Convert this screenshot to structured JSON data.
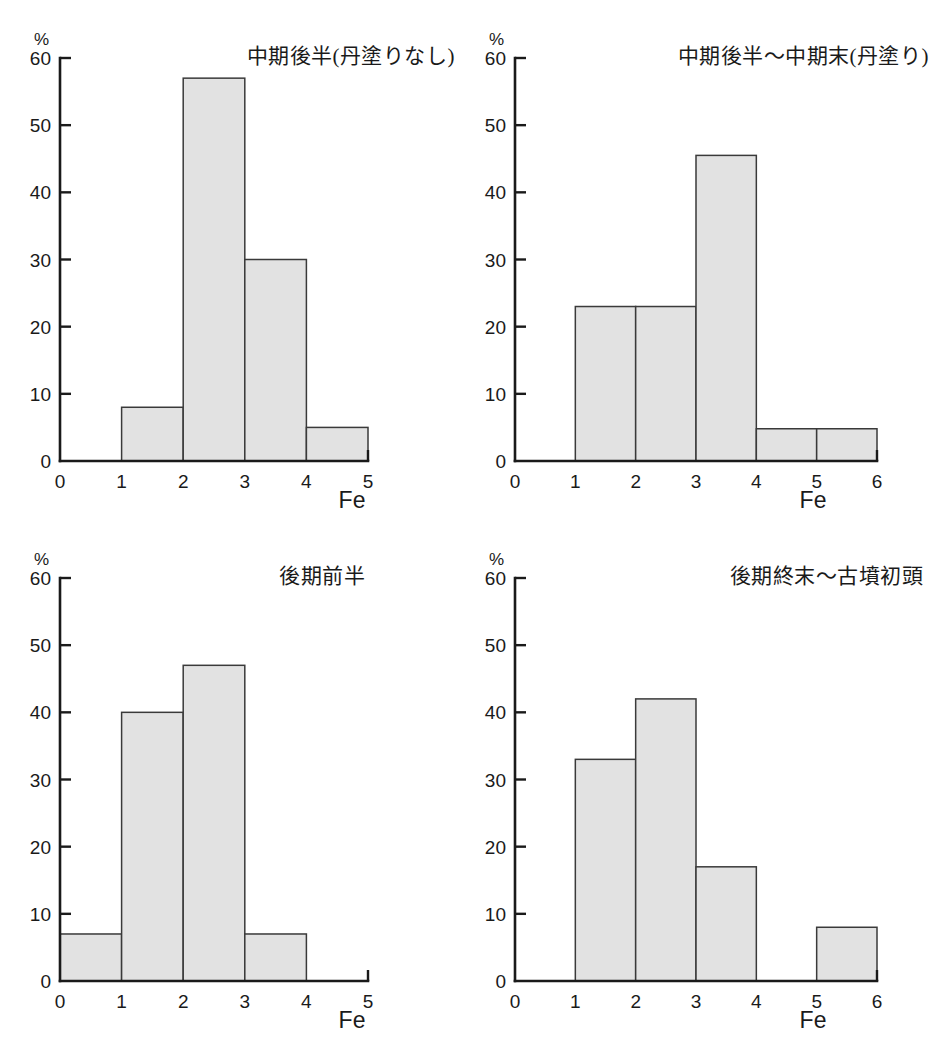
{
  "figure": {
    "background_color": "#ffffff",
    "bar_fill_color": "#e2e2e2",
    "bar_stroke_color": "#3a3a3a",
    "axis_color": "#1a1a1a",
    "y_unit_label": "%",
    "x_axis_title": "Fe",
    "caption": ""
  },
  "chart_data": [
    {
      "id": "chart-naka-kouhan-ninuri-nashi",
      "type": "bar",
      "title": "中期後半(丹塗りなし)",
      "xlabel": "Fe",
      "ylabel": "%",
      "xlim": [
        0,
        5
      ],
      "ylim": [
        0,
        60
      ],
      "grid": false,
      "legend": "none",
      "xticks": [
        "0",
        "1",
        "2",
        "3",
        "4",
        "5"
      ],
      "yticks": [
        "0",
        "10",
        "20",
        "30",
        "40",
        "50",
        "60"
      ],
      "bins": [
        {
          "x0": 0,
          "x1": 1,
          "value": 0
        },
        {
          "x0": 1,
          "x1": 2,
          "value": 8
        },
        {
          "x0": 2,
          "x1": 3,
          "value": 57
        },
        {
          "x0": 3,
          "x1": 4,
          "value": 30
        },
        {
          "x0": 4,
          "x1": 5,
          "value": 5
        }
      ]
    },
    {
      "id": "chart-naka-kouhan-naka-matsu-ninuri",
      "type": "bar",
      "title": "中期後半〜中期末(丹塗り)",
      "xlabel": "Fe",
      "ylabel": "%",
      "xlim": [
        0,
        6
      ],
      "ylim": [
        0,
        60
      ],
      "grid": false,
      "legend": "none",
      "xticks": [
        "0",
        "1",
        "2",
        "3",
        "4",
        "5",
        "6"
      ],
      "yticks": [
        "0",
        "10",
        "20",
        "30",
        "40",
        "50",
        "60"
      ],
      "bins": [
        {
          "x0": 0,
          "x1": 1,
          "value": 0
        },
        {
          "x0": 1,
          "x1": 2,
          "value": 23
        },
        {
          "x0": 2,
          "x1": 3,
          "value": 23
        },
        {
          "x0": 3,
          "x1": 4,
          "value": 45.5
        },
        {
          "x0": 4,
          "x1": 5,
          "value": 4.8
        },
        {
          "x0": 5,
          "x1": 6,
          "value": 4.8
        }
      ]
    },
    {
      "id": "chart-kouki-zenhan",
      "type": "bar",
      "title": "後期前半",
      "xlabel": "Fe",
      "ylabel": "%",
      "xlim": [
        0,
        5
      ],
      "ylim": [
        0,
        60
      ],
      "grid": false,
      "legend": "none",
      "xticks": [
        "0",
        "1",
        "2",
        "3",
        "4",
        "5"
      ],
      "yticks": [
        "0",
        "10",
        "20",
        "30",
        "40",
        "50",
        "60"
      ],
      "bins": [
        {
          "x0": 0,
          "x1": 1,
          "value": 7
        },
        {
          "x0": 1,
          "x1": 2,
          "value": 40
        },
        {
          "x0": 2,
          "x1": 3,
          "value": 47
        },
        {
          "x0": 3,
          "x1": 4,
          "value": 7
        },
        {
          "x0": 4,
          "x1": 5,
          "value": 0
        }
      ]
    },
    {
      "id": "chart-kouki-shumatsu-kofun-shotou",
      "type": "bar",
      "title": "後期終末〜古墳初頭",
      "xlabel": "Fe",
      "ylabel": "%",
      "xlim": [
        0,
        6
      ],
      "ylim": [
        0,
        60
      ],
      "grid": false,
      "legend": "none",
      "xticks": [
        "0",
        "1",
        "2",
        "3",
        "4",
        "5",
        "6"
      ],
      "yticks": [
        "0",
        "10",
        "20",
        "30",
        "40",
        "50",
        "60"
      ],
      "bins": [
        {
          "x0": 0,
          "x1": 1,
          "value": 0
        },
        {
          "x0": 1,
          "x1": 2,
          "value": 33
        },
        {
          "x0": 2,
          "x1": 3,
          "value": 42
        },
        {
          "x0": 3,
          "x1": 4,
          "value": 17
        },
        {
          "x0": 4,
          "x1": 5,
          "value": 0
        },
        {
          "x0": 5,
          "x1": 6,
          "value": 8
        }
      ]
    }
  ]
}
